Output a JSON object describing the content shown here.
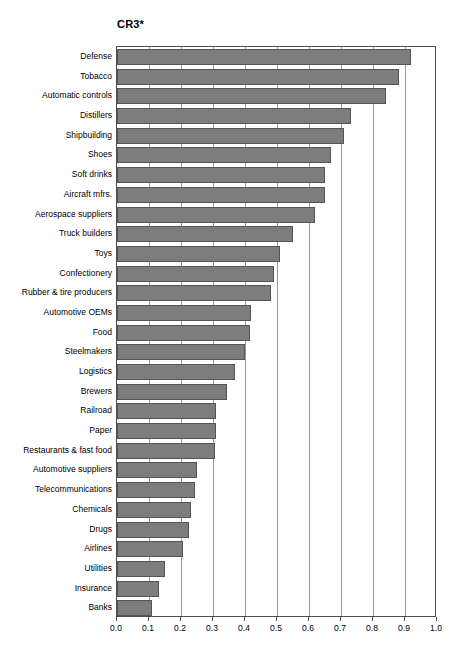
{
  "chart_data": {
    "type": "bar",
    "orientation": "horizontal",
    "title": "CR3*",
    "xlabel": "",
    "ylabel": "",
    "xlim": [
      0.0,
      1.0
    ],
    "xticks": [
      "0.0",
      "0.1",
      "0.2",
      "0.3",
      "0.4",
      "0.5",
      "0.6",
      "0.7",
      "0.8",
      "0.9",
      "1.0"
    ],
    "grid": "vertical",
    "legend": "none",
    "bar_color": "#7d7d7d",
    "bar_edge_color": "#555555",
    "axis_color": "#4d4d4d",
    "gridline_color": "#9a9a9a",
    "categories": [
      "Defense",
      "Tobacco",
      "Automatic controls",
      "Distillers",
      "Shipbuilding",
      "Shoes",
      "Soft drinks",
      "Aircraft mfrs.",
      "Aerospace suppliers",
      "Truck builders",
      "Toys",
      "Confectionery",
      "Rubber & tire producers",
      "Automotive OEMs",
      "Food",
      "Steelmakers",
      "Logistics",
      "Brewers",
      "Railroad",
      "Paper",
      "Restaurants & fast food",
      "Automotive suppliers",
      "Telecommunications",
      "Chemicals",
      "Drugs",
      "Airlines",
      "Utilities",
      "Insurance",
      "Banks"
    ],
    "values": [
      0.92,
      0.88,
      0.84,
      0.73,
      0.71,
      0.67,
      0.65,
      0.65,
      0.62,
      0.55,
      0.51,
      0.49,
      0.48,
      0.42,
      0.415,
      0.4,
      0.37,
      0.345,
      0.31,
      0.31,
      0.305,
      0.25,
      0.245,
      0.23,
      0.225,
      0.205,
      0.15,
      0.13,
      0.11
    ]
  }
}
